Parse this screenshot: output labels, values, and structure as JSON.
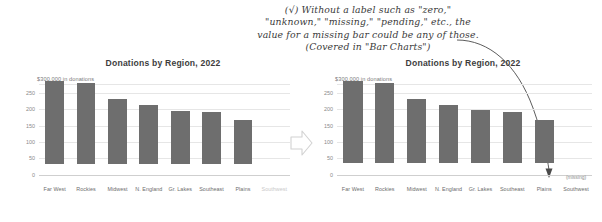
{
  "annotation": {
    "check_glyph": "(√)",
    "lines": [
      "(√) Without a label such as \"zero,\"",
      "\"unknown,\" \"missing,\" \"pending,\" etc., the",
      "value for a missing bar could be any of those.",
      "(Covered in \"Bar Charts\")"
    ]
  },
  "colors": {
    "bar": "#6e6e6e",
    "gridline": "#e6e6e6",
    "axis_text": "#8a8a8a",
    "annotation_text": "#3a3a3a"
  },
  "chart_data": [
    {
      "id": "left",
      "type": "bar",
      "title": "Donations by Region, 2022",
      "axis_caption": "$300,000 in donations",
      "xlabel": "",
      "ylabel": "",
      "ylim": [
        0,
        300
      ],
      "yticks": [
        250,
        200,
        150,
        100,
        50,
        0
      ],
      "ytick_labels": [
        "250",
        "200",
        "150",
        "100",
        "50",
        "0"
      ],
      "grid": true,
      "categories": [
        "Far West",
        "Rockies",
        "Midwest",
        "N. England",
        "Gr. Lakes",
        "Southeast",
        "Plains",
        "Southwest"
      ],
      "values": [
        272,
        267,
        212,
        193,
        175,
        170,
        143,
        null
      ],
      "faded_categories": [
        "Southwest"
      ],
      "annotations": []
    },
    {
      "id": "right",
      "type": "bar",
      "title": "Donations by Region, 2022",
      "axis_caption": "$300,000 in donations",
      "xlabel": "",
      "ylabel": "",
      "ylim": [
        0,
        300
      ],
      "yticks": [
        250,
        200,
        150,
        100,
        50,
        0
      ],
      "ytick_labels": [
        "250",
        "200",
        "150",
        "100",
        "50",
        "0"
      ],
      "grid": true,
      "categories": [
        "Far West",
        "Rockies",
        "Midwest",
        "N. England",
        "Gr. Lakes",
        "Southeast",
        "Plains",
        "Southwest"
      ],
      "values": [
        272,
        267,
        212,
        193,
        175,
        170,
        143,
        null
      ],
      "faded_categories": [],
      "annotations": [
        {
          "text": "(missing)",
          "category": "Southwest"
        }
      ]
    }
  ],
  "transform_arrow": {
    "direction": "right",
    "label": ""
  }
}
